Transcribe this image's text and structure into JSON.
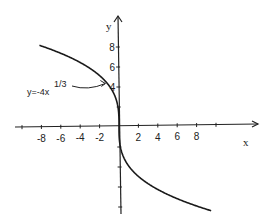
{
  "chart_data": {
    "type": "line",
    "title": "",
    "xlabel": "x",
    "ylabel": "y",
    "function": "y=-4x^(1/3)",
    "xlim": [
      -11,
      14
    ],
    "ylim": [
      -9,
      11
    ],
    "x_ticks": [
      -8,
      -6,
      -4,
      -2,
      2,
      4,
      6,
      8
    ],
    "x_tick_labels": [
      "-8",
      "-6",
      "-4",
      "-2",
      "2",
      "4",
      "6",
      "8"
    ],
    "x_minor_ticks": [
      -10,
      10
    ],
    "y_ticks": [
      4,
      6,
      8
    ],
    "y_tick_labels": [
      "4",
      "6",
      "8"
    ],
    "y_minor_ticks": [
      2,
      -2,
      -4,
      -6,
      -8
    ],
    "grid": false,
    "series": [
      {
        "name": "y=-4x^(1/3)",
        "x_range": [
          -8.2,
          9.5
        ]
      }
    ],
    "annotations": [
      {
        "text": "y=-4x",
        "superscript": "1/3",
        "points_to": [
          -1.2,
          4.25
        ]
      }
    ]
  }
}
